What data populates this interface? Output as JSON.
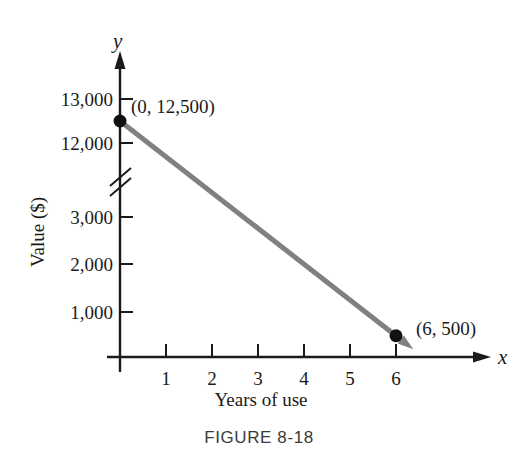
{
  "figure": {
    "caption": "FIGURE  8-18",
    "x_axis_title": "Years of use",
    "y_axis_title": "Value ($)",
    "x_axis_variable": "x",
    "y_axis_variable": "y"
  },
  "chart_data": {
    "type": "line",
    "title": "",
    "xlabel": "Years of use",
    "ylabel": "Value ($)",
    "x_variable": "x",
    "y_variable": "y",
    "xlim": [
      0,
      6.6
    ],
    "ylim": [
      0,
      13500
    ],
    "grid": false,
    "legend": null,
    "axis_break": {
      "axis": "y",
      "between": [
        3000,
        12000
      ],
      "style": "double-slash"
    },
    "x_ticks": [
      1,
      2,
      3,
      4,
      5,
      6
    ],
    "x_tick_labels": [
      "1",
      "2",
      "3",
      "4",
      "5",
      "6"
    ],
    "y_ticks": [
      1000,
      2000,
      3000,
      12000,
      13000
    ],
    "y_tick_labels": [
      "1,000",
      "2,000",
      "3,000",
      "12,000",
      "13,000"
    ],
    "series": [
      {
        "name": "Value",
        "color": "#808080",
        "x": [
          0,
          6
        ],
        "y": [
          12500,
          500
        ],
        "points": [
          {
            "x": 0,
            "y": 12500,
            "label": "(0, 12,500)"
          },
          {
            "x": 6,
            "y": 500,
            "label": "(6, 500)"
          }
        ]
      }
    ],
    "annotations": [
      {
        "text": "(0, 12,500)",
        "x": 0,
        "y": 12500
      },
      {
        "text": "(6, 500)",
        "x": 6,
        "y": 500
      }
    ]
  },
  "geometry": {
    "tick_labels_y": [
      {
        "text": "13,000",
        "px": 100
      },
      {
        "text": "12,000",
        "px": 144
      },
      {
        "text": "3,000",
        "px": 218
      },
      {
        "text": "2,000",
        "px": 265
      },
      {
        "text": "1,000",
        "px": 313
      }
    ],
    "tick_labels_x": [
      {
        "text": "1",
        "px": 166
      },
      {
        "text": "2",
        "px": 212
      },
      {
        "text": "3",
        "px": 258
      },
      {
        "text": "4",
        "px": 304
      },
      {
        "text": "5",
        "px": 350
      },
      {
        "text": "6",
        "px": 396
      }
    ]
  }
}
